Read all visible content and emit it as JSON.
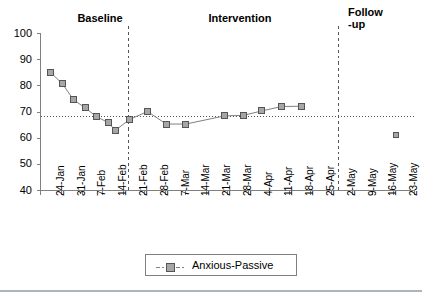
{
  "chart_data": {
    "type": "line",
    "title": "",
    "xlabel": "",
    "ylabel": "",
    "ylim": [
      40,
      100
    ],
    "ytick_step": 10,
    "yticks": [
      100,
      90,
      80,
      70,
      60,
      50,
      40
    ],
    "grid": false,
    "legend_position": "bottom-center",
    "categories": [
      "24-Jan",
      "31-Jan",
      "7-Feb",
      "14-Feb",
      "21-Feb",
      "28-Feb",
      "7-Mar",
      "14-Mar",
      "21-Mar",
      "28-Mar",
      "4-Apr",
      "11-Apr",
      "18-Apr",
      "25-Apr",
      "2-May",
      "9-May",
      "16-May",
      "23-May"
    ],
    "series": [
      {
        "name": "Anxious-Passive",
        "marker": "square",
        "marker_color": "#a6a6a6",
        "line_color": "#808080",
        "points": [
          {
            "x": 0.0,
            "label": "24-Jan",
            "y": 85.0
          },
          {
            "x": 0.55,
            "label": "27-Jan",
            "y": 80.8
          },
          {
            "x": 1.1,
            "label": "31-Jan",
            "y": 74.6
          },
          {
            "x": 1.65,
            "label": "4-Feb",
            "y": 71.6
          },
          {
            "x": 2.2,
            "label": "8-Feb",
            "y": 68.2
          },
          {
            "x": 2.75,
            "label": "12-Feb",
            "y": 66.0
          },
          {
            "x": 3.1,
            "label": "14-Feb",
            "y": 63.0
          },
          {
            "x": 3.8,
            "label": "18-Feb",
            "y": 67.2
          },
          {
            "x": 4.65,
            "label": "25-Feb",
            "y": 70.2
          },
          {
            "x": 5.55,
            "label": "4-Mar",
            "y": 65.4
          },
          {
            "x": 6.5,
            "label": "11-Mar",
            "y": 65.4
          },
          {
            "x": 8.35,
            "label": "25-Mar",
            "y": 68.5
          },
          {
            "x": 9.25,
            "label": "1-Apr",
            "y": 68.7
          },
          {
            "x": 10.15,
            "label": "8-Apr",
            "y": 70.4
          },
          {
            "x": 11.1,
            "label": "15-Apr",
            "y": 72.1
          },
          {
            "x": 12.05,
            "label": "22-Apr",
            "y": 72.2
          },
          {
            "x": 16.6,
            "label": "22-May",
            "y": 61.2,
            "isolated": true
          }
        ]
      }
    ],
    "reference_line": {
      "type": "horizontal-dotted",
      "value": 68.3,
      "color": "#555555"
    },
    "phase_dividers": [
      {
        "after_category": "21-Feb",
        "x": 4.22,
        "style": "dashed"
      },
      {
        "after_category": "2-May",
        "x": 14.35,
        "style": "dashed"
      }
    ],
    "phases": [
      {
        "name": "Baseline",
        "label": "Baseline"
      },
      {
        "name": "Intervention",
        "label": "Intervention"
      },
      {
        "name": "Follow-up",
        "label": "Follow\n-up"
      }
    ]
  },
  "legend": {
    "entries": [
      {
        "label": "Anxious-Passive",
        "marker": "square-with-line"
      }
    ]
  },
  "axes": {
    "y_labels": [
      "100",
      "90",
      "80",
      "70",
      "60",
      "50",
      "40"
    ],
    "x_labels": [
      "24-Jan",
      "31-Jan",
      "7-Feb",
      "14-Feb",
      "21-Feb",
      "28-Feb",
      "7-Mar",
      "14-Mar",
      "21-Mar",
      "28-Mar",
      "4-Apr",
      "11-Apr",
      "18-Apr",
      "25-Apr",
      "2-May",
      "9-May",
      "16-May",
      "23-May"
    ]
  },
  "colors": {
    "axis": "#808080",
    "marker_fill": "#a6a6a6",
    "marker_stroke": "#555555",
    "line": "#808080",
    "reference": "#555555",
    "divider": "#555555",
    "text": "#000000",
    "footer_rule": "#aab4bf"
  }
}
